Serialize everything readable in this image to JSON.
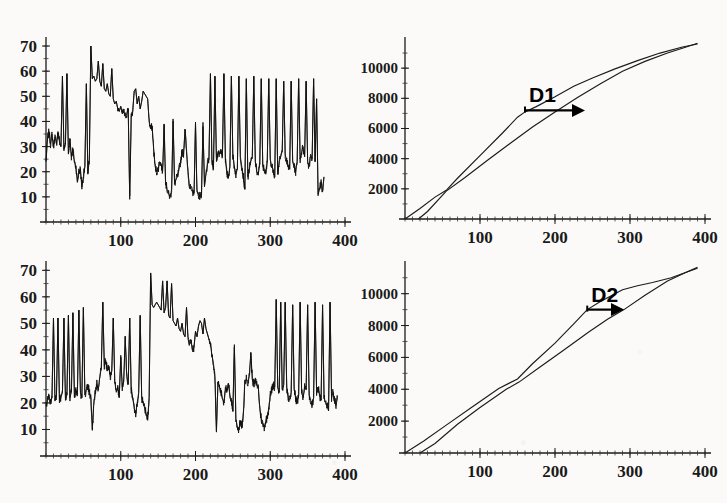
{
  "figure": {
    "background_color": "#fbfaf8",
    "ink_color": "#1b1b1b",
    "panel_count": 4,
    "layout": "2x2"
  },
  "annotations": {
    "d1": "D1",
    "d2": "D2"
  },
  "axis_labels": {
    "x_ticks": [
      "100",
      "200",
      "300",
      "400"
    ],
    "y_ticks_left": [
      "70",
      "60",
      "50",
      "40",
      "30",
      "20",
      "10"
    ],
    "y_ticks_right": [
      "10000",
      "8000",
      "6000",
      "4000",
      "2000"
    ]
  },
  "chart_data": [
    {
      "id": "top-left",
      "type": "line",
      "title": "",
      "xlabel": "",
      "ylabel": "",
      "xlim": [
        0,
        400
      ],
      "ylim": [
        0,
        72
      ],
      "xticks": [
        100,
        200,
        300,
        400
      ],
      "yticks": [
        10,
        20,
        30,
        40,
        50,
        60,
        70
      ],
      "grid": false,
      "legend": "none",
      "description": "Noisy spiky time series, baseline drifting from ~33 down to ~20 with tall narrow spikes to 50-60",
      "series": [
        {
          "name": "signal-1",
          "x": [
            0,
            2,
            4,
            6,
            8,
            10,
            12,
            14,
            16,
            18,
            20,
            22,
            24,
            26,
            28,
            30,
            32,
            34,
            36,
            38,
            40,
            42,
            44,
            46,
            48,
            50,
            52,
            54,
            56,
            58,
            60,
            62,
            64,
            66,
            68,
            70,
            72,
            74,
            76,
            78,
            80,
            82,
            84,
            86,
            88,
            90,
            92,
            94,
            96,
            98,
            100,
            102,
            104,
            106,
            108,
            110,
            112,
            114,
            116,
            118,
            120,
            122,
            124,
            126,
            128,
            130,
            132,
            134,
            136,
            138,
            140,
            142,
            144,
            146,
            148,
            150,
            152,
            154,
            156,
            158,
            160,
            162,
            164,
            166,
            168,
            170,
            172,
            174,
            176,
            178,
            180,
            182,
            184,
            186,
            188,
            190,
            192,
            194,
            196,
            198,
            200,
            202,
            204,
            206,
            208,
            210,
            212,
            214,
            216,
            218,
            220,
            222,
            224,
            226,
            228,
            230,
            232,
            234,
            236,
            238,
            240,
            242,
            244,
            246,
            248,
            250,
            252,
            254,
            256,
            258,
            260,
            262,
            264,
            266,
            268,
            270,
            272,
            274,
            276,
            278,
            280,
            282,
            284,
            286,
            288,
            290,
            292,
            294,
            296,
            298,
            300,
            302,
            304,
            306,
            308,
            310,
            312,
            314,
            316,
            318,
            320,
            322,
            324,
            326,
            328,
            330,
            332,
            334,
            336,
            338,
            340,
            342,
            344,
            346,
            348,
            350,
            352,
            354,
            356,
            358,
            360,
            362,
            364,
            366,
            368,
            370,
            372,
            374,
            376,
            378,
            380,
            382,
            384,
            386,
            388,
            390
          ],
          "y": [
            24,
            33,
            36,
            31,
            35,
            30,
            34,
            31,
            36,
            32,
            30,
            58,
            29,
            31,
            59,
            27,
            33,
            26,
            29,
            24,
            22,
            16,
            20,
            21,
            14,
            18,
            22,
            55,
            19,
            25,
            70,
            57,
            58,
            56,
            57,
            64,
            56,
            54,
            63,
            53,
            52,
            55,
            51,
            50,
            61,
            49,
            47,
            48,
            45,
            44,
            46,
            43,
            44,
            42,
            43,
            45,
            9,
            42,
            44,
            52,
            53,
            47,
            50,
            45,
            48,
            52,
            51,
            50,
            49,
            40,
            37,
            38,
            29,
            22,
            20,
            21,
            24,
            23,
            20,
            39,
            16,
            13,
            11,
            10,
            12,
            41,
            15,
            17,
            18,
            21,
            24,
            28,
            27,
            37,
            28,
            20,
            14,
            13,
            12,
            11,
            39,
            12,
            11,
            10,
            11,
            38,
            14,
            19,
            23,
            25,
            59,
            24,
            21,
            58,
            24,
            28,
            27,
            29,
            26,
            59,
            25,
            19,
            18,
            22,
            58,
            26,
            22,
            19,
            21,
            58,
            26,
            22,
            18,
            13,
            57,
            18,
            21,
            24,
            26,
            58,
            24,
            20,
            19,
            23,
            57,
            22,
            21,
            19,
            24,
            57,
            25,
            22,
            21,
            18,
            57,
            19,
            24,
            26,
            28,
            56,
            27,
            24,
            22,
            21,
            56,
            24,
            22,
            20,
            24,
            57,
            25,
            28,
            30,
            26,
            56,
            24,
            22,
            27,
            25,
            57,
            24,
            49,
            11,
            13,
            16,
            12,
            18
          ]
        }
      ]
    },
    {
      "id": "top-right",
      "type": "line",
      "title": "",
      "xlabel": "",
      "ylabel": "",
      "xlim": [
        0,
        400
      ],
      "ylim": [
        0,
        11800
      ],
      "xticks": [
        100,
        200,
        300,
        400
      ],
      "yticks": [
        2000,
        4000,
        6000,
        8000,
        10000
      ],
      "grid": false,
      "legend": "none",
      "annotation": {
        "label": "D1",
        "x_start": 160,
        "x_end": 240,
        "y": 7200
      },
      "description": "Two monotone cumulative curves converging at x=390, y=11600; a horizontal lag arrow D1 spans the horizontal gap between them",
      "series": [
        {
          "name": "cumulative-reference",
          "x": [
            0,
            20,
            40,
            55,
            70,
            100,
            130,
            150,
            160,
            175,
            200,
            225,
            250,
            280,
            310,
            340,
            370,
            390
          ],
          "y": [
            0,
            700,
            1450,
            1900,
            2700,
            4200,
            5700,
            6750,
            7100,
            7450,
            8100,
            8800,
            9350,
            9950,
            10500,
            11000,
            11400,
            11600
          ]
        },
        {
          "name": "cumulative-delayed",
          "x": [
            18,
            30,
            55,
            80,
            110,
            140,
            170,
            200,
            230,
            240,
            260,
            290,
            320,
            350,
            375,
            390
          ],
          "y": [
            0,
            500,
            1850,
            2750,
            3900,
            5000,
            6100,
            7100,
            8050,
            8350,
            8950,
            9800,
            10450,
            11000,
            11400,
            11650
          ]
        }
      ]
    },
    {
      "id": "bottom-left",
      "type": "line",
      "title": "",
      "xlabel": "",
      "ylabel": "",
      "xlim": [
        0,
        400
      ],
      "ylim": [
        0,
        72
      ],
      "xticks": [
        100,
        200,
        300,
        400
      ],
      "yticks": [
        10,
        20,
        30,
        40,
        50,
        60,
        70
      ],
      "grid": false,
      "legend": "none",
      "description": "Noisy spiky time series; baseline near 20-25 early, hump to ~57 around x=150-210, troughs near 10-15 around x=250-300, spike cluster after x=310",
      "series": [
        {
          "name": "signal-2",
          "x": [
            0,
            2,
            4,
            6,
            8,
            10,
            12,
            14,
            16,
            18,
            20,
            22,
            24,
            26,
            28,
            30,
            32,
            34,
            36,
            38,
            40,
            42,
            44,
            46,
            48,
            50,
            52,
            54,
            56,
            58,
            60,
            62,
            64,
            66,
            68,
            70,
            72,
            74,
            76,
            78,
            80,
            82,
            84,
            86,
            88,
            90,
            92,
            94,
            96,
            98,
            100,
            102,
            104,
            106,
            108,
            110,
            112,
            114,
            116,
            118,
            120,
            122,
            124,
            126,
            128,
            130,
            132,
            134,
            136,
            138,
            140,
            142,
            144,
            146,
            148,
            150,
            152,
            154,
            156,
            158,
            160,
            162,
            164,
            166,
            168,
            170,
            172,
            174,
            176,
            178,
            180,
            182,
            184,
            186,
            188,
            190,
            192,
            194,
            196,
            198,
            200,
            202,
            204,
            206,
            208,
            210,
            212,
            214,
            216,
            218,
            220,
            222,
            224,
            226,
            228,
            230,
            232,
            234,
            236,
            238,
            240,
            242,
            244,
            246,
            248,
            250,
            252,
            254,
            256,
            258,
            260,
            262,
            264,
            266,
            268,
            270,
            272,
            274,
            276,
            278,
            280,
            282,
            284,
            286,
            288,
            290,
            292,
            294,
            296,
            298,
            300,
            302,
            304,
            306,
            308,
            310,
            312,
            314,
            316,
            318,
            320,
            322,
            324,
            326,
            328,
            330,
            332,
            334,
            336,
            338,
            340,
            342,
            344,
            346,
            348,
            350,
            352,
            354,
            356,
            358,
            360,
            362,
            364,
            366,
            368,
            370,
            372,
            374,
            376,
            378,
            380,
            382,
            384,
            386,
            388,
            390
          ],
          "y": [
            19,
            21,
            23,
            20,
            22,
            52,
            21,
            23,
            52,
            20,
            22,
            24,
            52,
            21,
            23,
            53,
            22,
            24,
            54,
            22,
            25,
            23,
            55,
            24,
            22,
            56,
            23,
            25,
            27,
            24,
            22,
            10,
            20,
            24,
            27,
            25,
            30,
            33,
            58,
            34,
            36,
            32,
            34,
            30,
            32,
            52,
            28,
            24,
            26,
            22,
            38,
            26,
            28,
            45,
            30,
            27,
            52,
            25,
            22,
            18,
            16,
            20,
            24,
            53,
            22,
            20,
            18,
            16,
            14,
            22,
            69,
            57,
            56,
            57,
            58,
            57,
            56,
            55,
            66,
            54,
            56,
            66,
            53,
            52,
            65,
            51,
            50,
            49,
            52,
            48,
            47,
            50,
            46,
            45,
            56,
            44,
            42,
            43,
            40,
            41,
            47,
            45,
            49,
            51,
            50,
            46,
            52,
            48,
            46,
            44,
            42,
            38,
            35,
            30,
            9,
            28,
            26,
            24,
            22,
            20,
            26,
            24,
            27,
            23,
            21,
            17,
            42,
            14,
            11,
            10,
            13,
            11,
            15,
            28,
            29,
            28,
            30,
            39,
            29,
            27,
            28,
            27,
            26,
            18,
            14,
            12,
            11,
            13,
            15,
            18,
            23,
            25,
            27,
            26,
            59,
            26,
            24,
            58,
            25,
            27,
            58,
            26,
            22,
            21,
            24,
            57,
            25,
            22,
            20,
            23,
            58,
            24,
            22,
            26,
            25,
            57,
            23,
            21,
            19,
            22,
            58,
            24,
            26,
            23,
            21,
            57,
            22,
            20,
            19,
            17,
            58,
            22,
            24,
            21,
            19,
            22
          ]
        }
      ]
    },
    {
      "id": "bottom-right",
      "type": "line",
      "title": "",
      "xlabel": "",
      "ylabel": "",
      "xlim": [
        0,
        400
      ],
      "ylim": [
        0,
        11800
      ],
      "xticks": [
        100,
        200,
        300,
        400
      ],
      "yticks": [
        2000,
        4000,
        6000,
        8000,
        10000
      ],
      "grid": false,
      "legend": "none",
      "annotation": {
        "label": "D2",
        "x_start": 243,
        "x_end": 292,
        "y": 9000
      },
      "description": "Two nearly coincident cumulative curves that separate after x=150 and rejoin at x=390, y=11600; horizontal lag arrow D2 marks the gap",
      "series": [
        {
          "name": "cumulative-reference",
          "x": [
            0,
            25,
            55,
            90,
            125,
            150,
            170,
            200,
            225,
            243,
            260,
            290,
            310,
            330,
            355,
            375,
            390
          ],
          "y": [
            0,
            750,
            1750,
            2900,
            4050,
            4650,
            5600,
            6900,
            8100,
            9000,
            9500,
            10250,
            10500,
            10700,
            11000,
            11350,
            11600
          ]
        },
        {
          "name": "cumulative-delayed",
          "x": [
            20,
            40,
            70,
            100,
            135,
            152,
            180,
            210,
            245,
            270,
            292,
            320,
            350,
            375,
            390
          ],
          "y": [
            0,
            600,
            1800,
            2850,
            4000,
            4450,
            5400,
            6400,
            7600,
            8400,
            9000,
            9900,
            10800,
            11350,
            11650
          ]
        }
      ]
    }
  ]
}
